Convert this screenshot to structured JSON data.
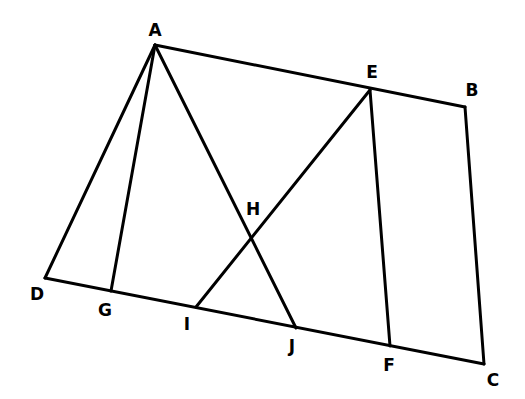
{
  "diagram": {
    "type": "geometry",
    "line_color": "#000000",
    "background": "#ffffff",
    "points": [
      {
        "id": "A",
        "label": "A",
        "x": 155,
        "y": 45,
        "lx": 155,
        "ly": 31
      },
      {
        "id": "E",
        "label": "E",
        "x": 370,
        "y": 90,
        "lx": 372,
        "ly": 73
      },
      {
        "id": "B",
        "label": "B",
        "x": 465,
        "y": 107,
        "lx": 472,
        "ly": 91
      },
      {
        "id": "C",
        "label": "C",
        "x": 484,
        "y": 364,
        "lx": 493,
        "ly": 381
      },
      {
        "id": "F",
        "label": "F",
        "x": 390,
        "y": 346,
        "lx": 389,
        "ly": 366
      },
      {
        "id": "J",
        "label": "J",
        "x": 296,
        "y": 328,
        "lx": 292,
        "ly": 347
      },
      {
        "id": "I",
        "label": "I",
        "x": 196,
        "y": 307,
        "lx": 187,
        "ly": 325
      },
      {
        "id": "G",
        "label": "G",
        "x": 111,
        "y": 291,
        "lx": 105,
        "ly": 311
      },
      {
        "id": "D",
        "label": "D",
        "x": 45,
        "y": 278,
        "lx": 37,
        "ly": 295
      },
      {
        "id": "H",
        "label": "H",
        "x": 251,
        "y": 236,
        "lx": 253,
        "ly": 210
      }
    ],
    "segments": [
      {
        "from": "A",
        "to": "B"
      },
      {
        "from": "B",
        "to": "C"
      },
      {
        "from": "D",
        "to": "C"
      },
      {
        "from": "A",
        "to": "D"
      },
      {
        "from": "A",
        "to": "G"
      },
      {
        "from": "A",
        "to": "J"
      },
      {
        "from": "E",
        "to": "I"
      },
      {
        "from": "E",
        "to": "F"
      }
    ]
  }
}
